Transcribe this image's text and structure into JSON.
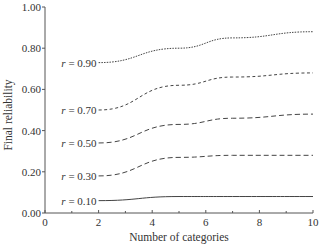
{
  "chart_data": {
    "type": "line",
    "title": "",
    "xlabel": "Number of categories",
    "ylabel": "Final reliability",
    "xlim": [
      0,
      10
    ],
    "ylim": [
      0,
      1.0
    ],
    "x_ticks": [
      0,
      2,
      4,
      6,
      8,
      10
    ],
    "x_tick_labels": [
      "0",
      "2",
      "4",
      "6",
      "8",
      "10"
    ],
    "x_minor_ticks": [
      1,
      3,
      5,
      7,
      9
    ],
    "y_ticks": [
      0,
      0.2,
      0.4,
      0.6,
      0.8,
      1.0
    ],
    "y_tick_labels": [
      "0.00",
      "0.20",
      "0.40",
      "0.60",
      "0.80",
      "1.00"
    ],
    "grid": false,
    "legend": "inline labels at left end of each line",
    "x": [
      2,
      5,
      7,
      10
    ],
    "series": [
      {
        "name": "r = 0.90",
        "label_r": "r",
        "label_val": "= 0.90",
        "style": "dotted",
        "values": [
          0.73,
          0.8,
          0.85,
          0.88
        ]
      },
      {
        "name": "r = 0.70",
        "label_r": "r",
        "label_val": "= 0.70",
        "style": "short-dash",
        "values": [
          0.5,
          0.62,
          0.66,
          0.68
        ]
      },
      {
        "name": "r = 0.50",
        "label_r": "r",
        "label_val": "= 0.50",
        "style": "dash",
        "values": [
          0.34,
          0.43,
          0.46,
          0.48
        ]
      },
      {
        "name": "r = 0.30",
        "label_r": "r",
        "label_val": "= 0.30",
        "style": "dash",
        "values": [
          0.18,
          0.27,
          0.28,
          0.28
        ]
      },
      {
        "name": "r = 0.10",
        "label_r": "r",
        "label_val": "= 0.10",
        "style": "solid",
        "values": [
          0.06,
          0.08,
          0.08,
          0.08
        ]
      }
    ]
  }
}
